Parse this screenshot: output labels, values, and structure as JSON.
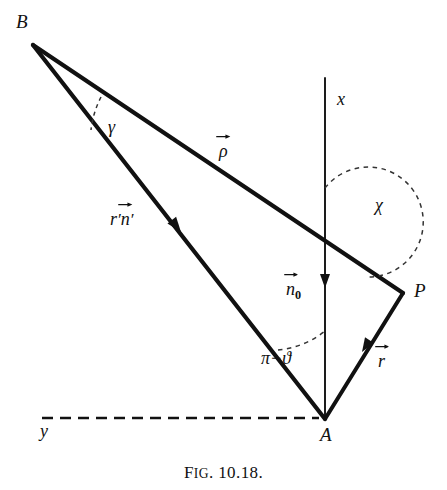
{
  "figure": {
    "caption_prefix": "F",
    "caption_smallcaps": "IG",
    "caption_number": ". 10.18.",
    "caption_full": "FIG. 10.18.",
    "background_color": "#ffffff",
    "ink_color": "#111111",
    "width": 447,
    "height": 490
  },
  "vertices": {
    "B": {
      "label": "B",
      "x": 33,
      "y": 45,
      "label_x": 18,
      "label_y": 18
    },
    "A": {
      "label": "A",
      "x": 325,
      "y": 419,
      "label_x": 321,
      "label_y": 428
    },
    "P": {
      "label": "P",
      "x": 403,
      "y": 293,
      "label_x": 415,
      "label_y": 283
    }
  },
  "axes": {
    "x": {
      "label": "x",
      "label_x": 338,
      "label_y": 90,
      "from": [
        325,
        78
      ],
      "to": [
        325,
        419
      ],
      "style": "solid"
    },
    "y": {
      "label": "y",
      "label_x": 40,
      "label_y": 422,
      "from": [
        42,
        418
      ],
      "to": [
        318,
        418
      ],
      "style": "dashed"
    }
  },
  "vectors": {
    "rho": {
      "label": "ρ",
      "has_arrow_accent": true,
      "label_x": 220,
      "label_y": 142,
      "from": [
        33,
        45
      ],
      "to": [
        403,
        293
      ],
      "description": "rho vector from B to P"
    },
    "r_prime_n_prime": {
      "label_r": "r",
      "label_r_prime": "′",
      "label_n": "n",
      "label_n_prime": "′",
      "has_arrow_accent": true,
      "label_x": 112,
      "label_y": 210,
      "from": [
        33,
        45
      ],
      "to": [
        325,
        419
      ],
      "arrowhead_at": [
        172,
        222
      ],
      "arrowhead_direction": "toward-B",
      "description": "r-prime times n-prime unit vector along B to A line"
    },
    "n_zero": {
      "label": "n",
      "subscript": "0",
      "has_arrow_accent": true,
      "label_x": 287,
      "label_y": 281,
      "arrowhead_at": [
        325,
        297
      ],
      "arrowhead_direction": "up",
      "description": "n-sub-zero unit normal along positive x axis"
    },
    "r": {
      "label": "r",
      "has_arrow_accent": true,
      "label_x": 379,
      "label_y": 352,
      "from": [
        325,
        419
      ],
      "to": [
        403,
        293
      ],
      "arrowhead_at": [
        366,
        356
      ],
      "arrowhead_direction": "toward-P",
      "description": "r vector from A to P"
    }
  },
  "angles": {
    "gamma": {
      "label": "γ",
      "label_x": 110,
      "label_y": 118,
      "vertex": [
        33,
        45
      ],
      "arc_style": "dashed",
      "description": "angle at B between rho line and BA line"
    },
    "chi": {
      "label": "χ",
      "label_x": 376,
      "label_y": 197,
      "vertex": [
        325,
        243
      ],
      "arc_style": "dashed",
      "description": "angle at x-axis crossing between upward x axis and rho direction toward P"
    },
    "pi_minus_theta": {
      "label": "π−ϑ",
      "label_x": 263,
      "label_y": 349,
      "vertex": [
        325,
        419
      ],
      "arc_style": "dashed",
      "description": "angle at A between upward x axis and AB line"
    }
  },
  "segments": [
    {
      "name": "segment-B-P",
      "from": [
        33,
        45
      ],
      "to": [
        403,
        293
      ],
      "style": "solid",
      "weight": "thick"
    },
    {
      "name": "segment-B-A",
      "from": [
        33,
        45
      ],
      "to": [
        325,
        419
      ],
      "style": "solid",
      "weight": "thick"
    },
    {
      "name": "segment-A-P",
      "from": [
        325,
        419
      ],
      "to": [
        403,
        293
      ],
      "style": "solid",
      "weight": "thick"
    },
    {
      "name": "segment-x-axis",
      "from": [
        325,
        78
      ],
      "to": [
        325,
        419
      ],
      "style": "solid",
      "weight": "thin"
    },
    {
      "name": "segment-y-axis",
      "from": [
        42,
        418
      ],
      "to": [
        318,
        418
      ],
      "style": "dashed",
      "weight": "thin"
    }
  ]
}
